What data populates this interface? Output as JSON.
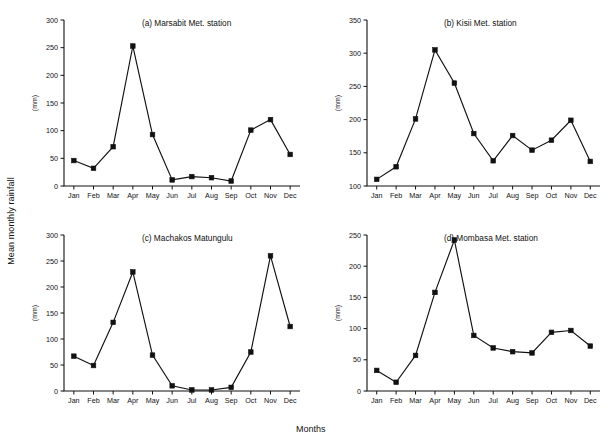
{
  "figure": {
    "shared_ylabel": "Mean monthly rainfall",
    "shared_xlabel": "Months",
    "background_color": "#ffffff",
    "ink_color": "#111111"
  },
  "chart_data": [
    {
      "id": "a",
      "type": "line",
      "title": "(a) Marsabit Met. station",
      "xlabel": "",
      "ylabel": "(mm)",
      "categories": [
        "Jan",
        "Feb",
        "Mar",
        "Apr",
        "May",
        "Jun",
        "Jul",
        "Aug",
        "Sep",
        "Oct",
        "Nov",
        "Dec"
      ],
      "values": [
        46,
        32,
        71,
        253,
        93,
        11,
        17,
        15,
        9,
        101,
        120,
        57
      ],
      "ylim": [
        0,
        300
      ],
      "yticks": [
        0,
        50,
        100,
        150,
        200,
        250,
        300
      ],
      "grid": false,
      "legend": "none",
      "marker": "square"
    },
    {
      "id": "b",
      "type": "line",
      "title": "(b) Kisii Met. station",
      "xlabel": "",
      "ylabel": "(mm)",
      "categories": [
        "Jan",
        "Feb",
        "Mar",
        "Apr",
        "May",
        "Jun",
        "Jul",
        "Aug",
        "Sep",
        "Oct",
        "Nov",
        "Dec"
      ],
      "values": [
        110,
        129,
        201,
        305,
        255,
        179,
        138,
        176,
        154,
        169,
        199,
        137
      ],
      "ylim": [
        100,
        350
      ],
      "yticks": [
        100,
        150,
        200,
        250,
        300,
        350
      ],
      "grid": false,
      "legend": "none",
      "marker": "square"
    },
    {
      "id": "c",
      "type": "line",
      "title": "(c) Machakos Matungulu",
      "xlabel": "",
      "ylabel": "(mm)",
      "categories": [
        "Jan",
        "Feb",
        "Mar",
        "Apr",
        "May",
        "Jun",
        "Jul",
        "Aug",
        "Sep",
        "Oct",
        "Nov",
        "Dec"
      ],
      "values": [
        67,
        49,
        132,
        229,
        69,
        10,
        2,
        2,
        7,
        75,
        260,
        124
      ],
      "ylim": [
        0,
        300
      ],
      "yticks": [
        0,
        50,
        100,
        150,
        200,
        250,
        300
      ],
      "grid": false,
      "legend": "none",
      "marker": "square"
    },
    {
      "id": "d",
      "type": "line",
      "title": "(d) Mombasa Met. station",
      "xlabel": "",
      "ylabel": "(mm)",
      "categories": [
        "Jan",
        "Feb",
        "Mar",
        "Apr",
        "May",
        "Jun",
        "Jul",
        "Aug",
        "Sep",
        "Oct",
        "Nov",
        "Dec"
      ],
      "values": [
        33,
        14,
        57,
        158,
        242,
        89,
        69,
        63,
        61,
        94,
        97,
        72
      ],
      "ylim": [
        0,
        250
      ],
      "yticks": [
        0,
        50,
        100,
        150,
        200,
        250
      ],
      "grid": false,
      "legend": "none",
      "marker": "square"
    }
  ]
}
